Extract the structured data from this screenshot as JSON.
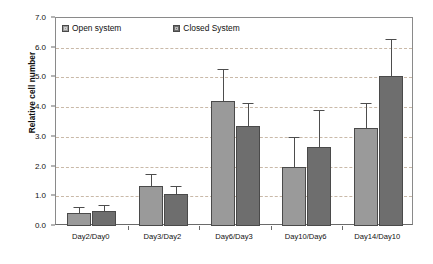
{
  "chart_data": {
    "type": "bar",
    "title": "",
    "xlabel": "",
    "ylabel": "Relative cell number",
    "ylim": [
      0.0,
      7.0
    ],
    "ytick_step": 1.0,
    "yticks": [
      "0.0",
      "1.0",
      "2.0",
      "3.0",
      "4.0",
      "5.0",
      "6.0",
      "7.0"
    ],
    "grid": "horizontal-dashed",
    "legend_position": "top-inside-left",
    "categories": [
      "Day2/Day0",
      "Day3/Day2",
      "Day6/Day3",
      "Day10/Day6",
      "Day14/Day10"
    ],
    "series": [
      {
        "name": "Open system",
        "color": "#9a9a9a",
        "values": [
          0.45,
          1.35,
          4.2,
          2.0,
          3.3
        ],
        "errors": [
          0.18,
          0.4,
          1.1,
          1.0,
          0.85
        ]
      },
      {
        "name": "Closed System",
        "color": "#6e6e6e",
        "values": [
          0.5,
          1.08,
          3.35,
          2.65,
          5.05
        ],
        "errors": [
          0.2,
          0.25,
          0.8,
          1.25,
          1.25
        ]
      }
    ]
  },
  "legend": {
    "items": [
      {
        "label": "Open system",
        "swatch": "open"
      },
      {
        "label": "Closed System",
        "swatch": "closed"
      }
    ]
  },
  "axes": {
    "y_title": "Relative cell number"
  }
}
